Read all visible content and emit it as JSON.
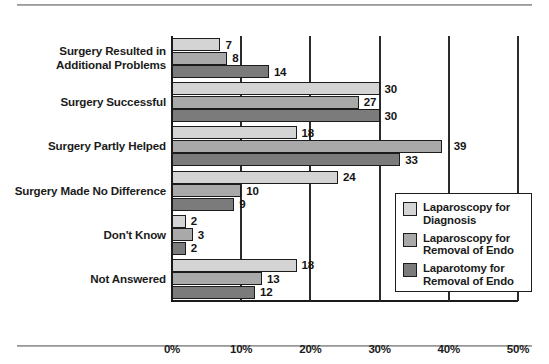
{
  "chart_data": {
    "type": "bar",
    "orientation": "horizontal",
    "title": "",
    "subtitle": "",
    "xlabel": "",
    "ylabel": "",
    "xlim": [
      0,
      50
    ],
    "xtick_labels": [
      "0%",
      "10%",
      "20%",
      "30%",
      "40%",
      "50%"
    ],
    "xtick_values": [
      0,
      10,
      20,
      30,
      40,
      50
    ],
    "grid": true,
    "grid_axis": "x",
    "legend_position": "center-right-inside",
    "value_labels": true,
    "value_label_suffix": "",
    "categories": [
      "Surgery Resulted in\nAdditional Problems",
      "Surgery Successful",
      "Surgery Partly Helped",
      "Surgery Made No Difference",
      "Don't Know",
      "Not Answered"
    ],
    "series": [
      {
        "name": "Laparoscopy for Diagnosis",
        "color": "#d4d4d4",
        "values": [
          7,
          30,
          18,
          24,
          2,
          18
        ]
      },
      {
        "name": "Laparoscopy for Removal of Endo",
        "color": "#a9a9a9",
        "values": [
          8,
          27,
          39,
          10,
          3,
          13
        ]
      },
      {
        "name": "Laparotomy for Removal of Endo",
        "color": "#7b7b7b",
        "values": [
          14,
          30,
          33,
          9,
          2,
          12
        ]
      }
    ]
  },
  "categories_display": [
    {
      "line1": "Surgery Resulted in",
      "line2": "Additional Problems"
    },
    {
      "line1": "Surgery Successful",
      "line2": ""
    },
    {
      "line1": "Surgery Partly Helped",
      "line2": ""
    },
    {
      "line1": "Surgery Made No Difference",
      "line2": ""
    },
    {
      "line1": "Don't Know",
      "line2": ""
    },
    {
      "line1": "Not Answered",
      "line2": ""
    }
  ],
  "legend": {
    "items": [
      {
        "line1": "Laparoscopy for",
        "line2": "Diagnosis",
        "color": "#d4d4d4"
      },
      {
        "line1": "Laparoscopy for",
        "line2": "Removal of Endo",
        "color": "#a9a9a9"
      },
      {
        "line1": "Laparotomy for",
        "line2": "Removal of Endo",
        "color": "#7b7b7b"
      }
    ]
  },
  "axis": {
    "ticks": [
      "0%",
      "10%",
      "20%",
      "30%",
      "40%",
      "50%"
    ]
  }
}
